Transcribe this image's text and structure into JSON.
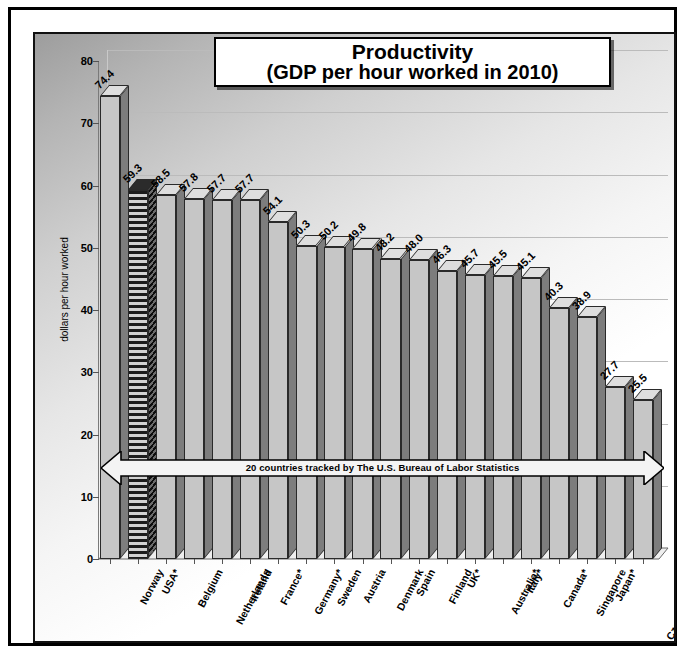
{
  "chart_data": {
    "type": "bar",
    "title": "Productivity",
    "subtitle": "(GDP per hour worked in 2010)",
    "xlabel": "",
    "ylabel": "dollars per hour worked",
    "ylim": [
      0,
      80
    ],
    "ytick_values": [
      0,
      10,
      20,
      30,
      40,
      50,
      60,
      70,
      80
    ],
    "grid": true,
    "legend": "none",
    "annotation": "20 countries tracked by The U.S. Bureau of Labor Statistics",
    "highlight_category": "USA*",
    "categories": [
      "Norway",
      "USA*",
      "Belgium",
      "Netherlands",
      "Ireland",
      "France*",
      "Germany*",
      "Sweden",
      "Austria",
      "Denmark",
      "Spain",
      "Finland",
      "UK*",
      "Australia*",
      "Italy*",
      "Canada*",
      "Singapore",
      "Japan*",
      "Czech Republic",
      "South Korea*"
    ],
    "values": [
      74.4,
      59.3,
      58.5,
      57.8,
      57.7,
      57.7,
      54.1,
      50.3,
      50.2,
      49.8,
      48.2,
      48.0,
      46.3,
      45.7,
      45.5,
      45.1,
      40.3,
      38.9,
      27.7,
      25.5
    ],
    "value_labels": [
      "74.4",
      "59.3",
      "58.5",
      "57.8",
      "57.7",
      "57.7",
      "54.1",
      "50.3",
      "50.2",
      "49.8",
      "48.2",
      "48.0",
      "46.3",
      "45.7",
      "45.5",
      "45.1",
      "40.3",
      "38.9",
      "27.7",
      "25.5"
    ],
    "ytick_labels": [
      "0",
      "10",
      "20",
      "30",
      "40",
      "50",
      "60",
      "70",
      "80"
    ],
    "colors": {
      "bar_front": "#c6c6c6",
      "bar_side": "#7d7d7d",
      "bar_top": "#dedede",
      "bar_outline": "#2a2a2a",
      "highlight_pattern": "horizontal-stripes",
      "grid": "#bbbbbb",
      "frame": "#000000",
      "text": "#000000"
    }
  }
}
